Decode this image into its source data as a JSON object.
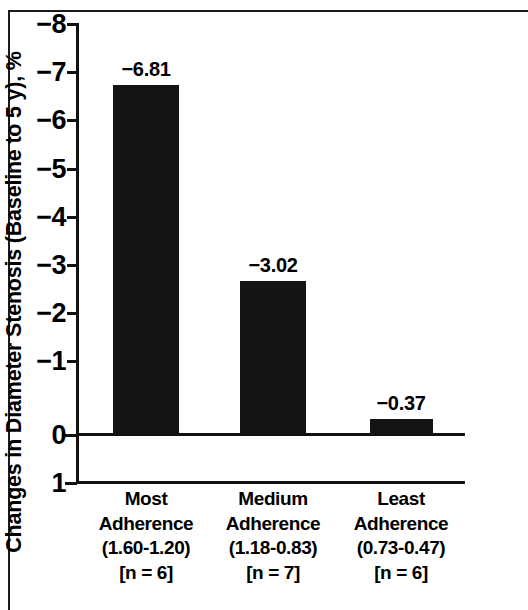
{
  "chart_data": {
    "type": "bar",
    "title": "",
    "xlabel": "",
    "ylabel": "Changes in Diameter Stenosis (Baseline to 5 y), %",
    "categories": [
      "Most Adherence (1.60-1.20) [n = 6]",
      "Medium Adherence (1.18-0.83) [n = 7]",
      "Least Adherence (0.73-0.47) [n = 6]"
    ],
    "values": [
      -6.81,
      -3.02,
      -0.37
    ],
    "value_labels": [
      "−6.81",
      "−3.02",
      "−0.37"
    ],
    "ylim": [
      1,
      -8
    ],
    "y_axis_inverted": true,
    "yticks": [
      -8,
      -7,
      -6,
      -5,
      -4,
      -3,
      -2,
      -1,
      0,
      1
    ],
    "ytick_labels": [
      "−8",
      "−7",
      "−6",
      "−5",
      "−4",
      "−3",
      "−2",
      "−1",
      "0",
      "1"
    ],
    "grid": false,
    "legend": null,
    "bar_color": "#141414",
    "axis_color": "#111111",
    "background": "#ffffff"
  },
  "axis": {
    "y_title": "Changes in Diameter Stenosis (Baseline to 5 y), %",
    "ticks": [
      {
        "value": -8,
        "label": "−8",
        "y": 0
      },
      {
        "value": -7,
        "label": "−7",
        "y": 48
      },
      {
        "value": -6,
        "label": "−6",
        "y": 96
      },
      {
        "value": -5,
        "label": "−5",
        "y": 145
      },
      {
        "value": -4,
        "label": "−4",
        "y": 193
      },
      {
        "value": -3,
        "label": "−3",
        "y": 241
      },
      {
        "value": -2,
        "label": "−2",
        "y": 289
      },
      {
        "value": -1,
        "label": "−1",
        "y": 337
      },
      {
        "value": 0,
        "label": "0",
        "y": 411
      },
      {
        "value": 1,
        "label": "1",
        "y": 459
      }
    ]
  },
  "bars": [
    {
      "name": "most-adherence",
      "label": "−6.81",
      "value": -6.81,
      "left": 37,
      "width": 66,
      "top": 62,
      "height": 349,
      "label_center": 70,
      "label_top": 36
    },
    {
      "name": "medium-adherence",
      "label": "−3.02",
      "value": -3.02,
      "left": 164,
      "width": 66,
      "top": 258,
      "height": 153,
      "label_center": 197,
      "label_top": 232
    },
    {
      "name": "least-adherence",
      "label": "−0.37",
      "value": -0.37,
      "left": 294,
      "width": 63,
      "top": 396,
      "height": 15,
      "label_center": 325,
      "label_top": 370
    }
  ],
  "categories": [
    {
      "name": "most-adherence",
      "line1": "Most",
      "line2": "Adherence",
      "line3": "(1.60-1.20)",
      "line4": "[n = 6]",
      "center": 70
    },
    {
      "name": "medium-adherence",
      "line1": "Medium",
      "line2": "Adherence",
      "line3": "(1.18-0.83)",
      "line4": "[n = 7]",
      "center": 197
    },
    {
      "name": "least-adherence",
      "line1": "Least",
      "line2": "Adherence",
      "line3": "(0.73-0.47)",
      "line4": "[n = 6]",
      "center": 325
    }
  ]
}
